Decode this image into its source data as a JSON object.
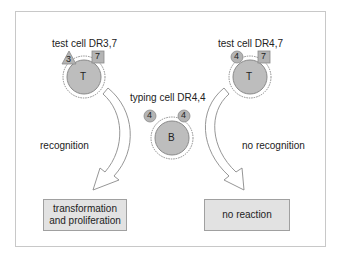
{
  "diagram": {
    "test_cell_left": {
      "label": "test cell DR3,7",
      "cell_letter": "T",
      "marker_triangle": "3",
      "marker_square": "7"
    },
    "typing_cell": {
      "label": "typing cell DR4,4",
      "cell_letter": "B",
      "marker_left": "4",
      "marker_right": "4"
    },
    "test_cell_right": {
      "label": "test cell DR4,7",
      "cell_letter": "T",
      "marker_circle": "4",
      "marker_square": "7"
    },
    "left_arrow_label": "recognition",
    "right_arrow_label": "no recognition",
    "left_outcome": {
      "line1": "transformation",
      "line2": "and proliferation"
    },
    "right_outcome": "no reaction",
    "colors": {
      "cell_fill": "#bdbdbd",
      "marker_fill": "#b4b4b4",
      "box_fill": "#e2e2e2",
      "frame": "#c8c8c8"
    }
  }
}
